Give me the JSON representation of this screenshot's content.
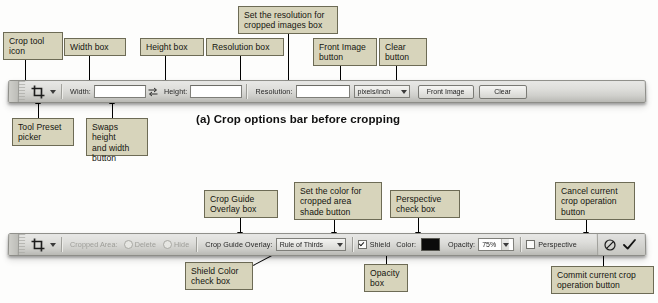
{
  "figure": {
    "caption_a": "(a) Crop options bar before cropping"
  },
  "top_callouts": [
    {
      "id": "crop-tool-icon",
      "text": "Crop tool\nicon"
    },
    {
      "id": "width-box",
      "text": "Width box"
    },
    {
      "id": "height-box",
      "text": "Height box"
    },
    {
      "id": "resolution-box",
      "text": "Resolution box"
    },
    {
      "id": "resolution-units",
      "text": "Set the resolution for\ncropped images box"
    },
    {
      "id": "front-image",
      "text": "Front Image\nbutton"
    },
    {
      "id": "clear-button",
      "text": "Clear\nbutton"
    },
    {
      "id": "tool-preset",
      "text": "Tool Preset\npicker"
    },
    {
      "id": "swap-button",
      "text": "Swaps height\nand width\nbutton"
    }
  ],
  "bottom_callouts": [
    {
      "id": "crop-guide-overlay",
      "text": "Crop Guide\nOverlay box"
    },
    {
      "id": "shade-color",
      "text": "Set the color for\ncropped area\nshade button"
    },
    {
      "id": "perspective",
      "text": "Perspective\ncheck box"
    },
    {
      "id": "cancel-crop",
      "text": "Cancel current\ncrop operation\nbutton"
    },
    {
      "id": "shield-color",
      "text": "Shield Color\ncheck box"
    },
    {
      "id": "opacity",
      "text": "Opacity\nbox"
    },
    {
      "id": "commit-crop",
      "text": "Commit current crop\noperation button"
    }
  ],
  "top_bar": {
    "tool_icon": "crop-tool-icon",
    "preset_caret": "chevron-down-icon",
    "width_label": "Width:",
    "width_value": "",
    "swap_icon": "swap-width-height-icon",
    "height_label": "Height:",
    "height_value": "",
    "resolution_label": "Resolution:",
    "resolution_value": "",
    "units_value": "pixels/inch",
    "units_caret": "chevron-down-icon",
    "front_image_label": "Front Image",
    "clear_label": "Clear"
  },
  "bottom_bar": {
    "tool_icon": "crop-tool-icon",
    "preset_caret": "chevron-down-icon",
    "cropped_area_label": "Cropped Area:",
    "delete_label": "Delete",
    "hide_label": "Hide",
    "overlay_label": "Crop Guide Overlay:",
    "overlay_value": "Rule of Thirds",
    "overlay_caret": "chevron-down-icon",
    "shield_label": "Shield",
    "color_label": "Color:",
    "color_swatch": "#0b0b0b",
    "opacity_label": "Opacity:",
    "opacity_value": "75%",
    "perspective_label": "Perspective",
    "cancel_icon": "cancel-circle-slash-icon",
    "commit_icon": "checkmark-icon"
  },
  "colors": {
    "callout_bg": "#d7d4bb",
    "callout_border": "#6d6b55",
    "bar_bg": "#dededb",
    "swatch": "#0b0b0b"
  }
}
